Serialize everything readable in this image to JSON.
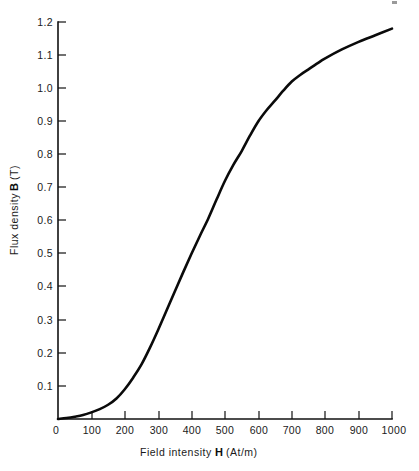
{
  "chart_data": {
    "type": "line",
    "title": "",
    "subtitle": "",
    "xlabel_prefix": "Field intensity",
    "xlabel_symbol": "H",
    "xlabel_units": "(At/m)",
    "xlabel": "Field intensity H (At/m)",
    "ylabel_prefix": "Flux density",
    "ylabel_symbol": "B",
    "ylabel_units": "(T)",
    "ylabel": "Flux density B (T)",
    "xlim": [
      0,
      1000
    ],
    "ylim": [
      0,
      1.2
    ],
    "grid": false,
    "legend": "none",
    "x_tick_labels": [
      "0",
      "100",
      "200",
      "300",
      "400",
      "500",
      "600",
      "700",
      "800",
      "900",
      "1000"
    ],
    "x_ticks": [
      0,
      100,
      200,
      300,
      400,
      500,
      600,
      700,
      800,
      900,
      1000
    ],
    "y_tick_labels": [
      "0",
      "0.1",
      "0.2",
      "0.3",
      "0.4",
      "0.5",
      "0.6",
      "0.7",
      "0.8",
      "0.9",
      "1.0",
      "1.1",
      "1.2"
    ],
    "y_ticks": [
      0,
      0.1,
      0.2,
      0.3,
      0.4,
      0.5,
      0.6,
      0.7,
      0.8,
      0.9,
      1.0,
      1.1,
      1.2
    ],
    "series": [
      {
        "name": "B-H magnetization curve",
        "color": "#0a0a0a",
        "x": [
          0,
          25,
          50,
          75,
          100,
          125,
          150,
          175,
          200,
          225,
          250,
          275,
          300,
          325,
          350,
          375,
          400,
          425,
          450,
          475,
          500,
          525,
          550,
          575,
          600,
          625,
          650,
          675,
          700,
          725,
          750,
          775,
          800,
          850,
          900,
          950,
          1000
        ],
        "y": [
          0.0,
          0.003,
          0.007,
          0.012,
          0.02,
          0.03,
          0.043,
          0.062,
          0.09,
          0.125,
          0.165,
          0.215,
          0.27,
          0.328,
          0.386,
          0.444,
          0.5,
          0.554,
          0.606,
          0.664,
          0.72,
          0.768,
          0.81,
          0.857,
          0.9,
          0.934,
          0.963,
          0.993,
          1.02,
          1.04,
          1.057,
          1.074,
          1.09,
          1.117,
          1.14,
          1.16,
          1.18
        ]
      }
    ]
  },
  "axes": {
    "x_axis_name": "x-axis",
    "y_axis_name": "y-axis"
  }
}
